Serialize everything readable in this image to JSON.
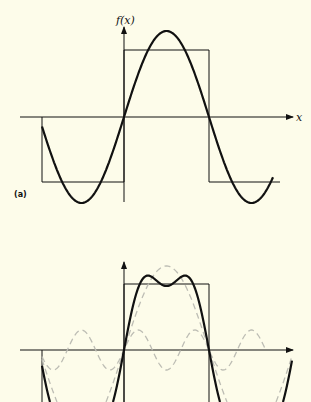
{
  "panel_a": {
    "tag": "(a)",
    "y_axis_label": "f(x)",
    "x_axis_label": "x"
  },
  "panel_b": {
    "tag": ""
  },
  "colors": {
    "background": "#fdfcea",
    "ink": "#111111",
    "dashed": "#bdbdb4"
  },
  "chart_data": [
    {
      "type": "line",
      "title": "(a) Square wave and first Fourier term",
      "xlabel": "x",
      "ylabel": "f(x)",
      "series": [
        {
          "name": "square wave",
          "style": "thin solid",
          "description": "-1 for x in (-pi,0), +1 for x in (0,pi), -1 for x in (pi,2pi)"
        },
        {
          "name": "fundamental (4/pi) sin x",
          "style": "bold solid",
          "amplitude_ratio_to_square": 1.27
        }
      ],
      "x_range": [
        "-pi",
        "~1.9pi"
      ],
      "grid": false
    },
    {
      "type": "line",
      "title": "(b) Sum of first two Fourier terms",
      "series": [
        {
          "name": "square wave",
          "style": "thin solid"
        },
        {
          "name": "fundamental (4/pi) sin x",
          "style": "grey dashed"
        },
        {
          "name": "third harmonic (4/3pi) sin 3x",
          "style": "grey dashed"
        },
        {
          "name": "sum of first two terms",
          "style": "bold solid",
          "description": "two peaks near x=pi/4 and 3pi/4 with dip at pi/2"
        }
      ],
      "grid": false
    }
  ]
}
